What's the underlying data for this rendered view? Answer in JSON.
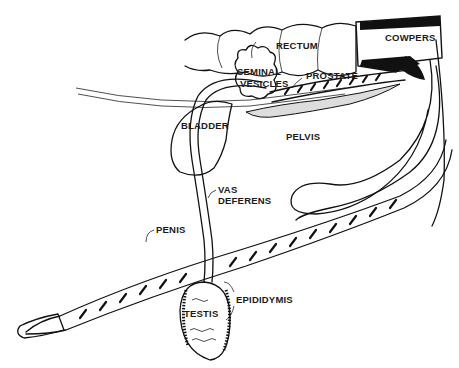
{
  "diagram": {
    "background": "#ffffff",
    "ink_color": "#111111",
    "labels": [
      {
        "id": "rectum",
        "text": "RECTUM",
        "x": 276,
        "y": 40
      },
      {
        "id": "cowpers",
        "text": "COWPERS",
        "x": 385,
        "y": 32
      },
      {
        "id": "seminal_vesicles_1",
        "text": "SEMINAL",
        "x": 237,
        "y": 68
      },
      {
        "id": "seminal_vesicles_2",
        "text": "VESICLES",
        "x": 240,
        "y": 81
      },
      {
        "id": "prostate",
        "text": "PROSTATE",
        "x": 306,
        "y": 72
      },
      {
        "id": "bladder",
        "text": "BLADDER",
        "x": 181,
        "y": 120
      },
      {
        "id": "pelvis",
        "text": "PELVIS",
        "x": 286,
        "y": 133
      },
      {
        "id": "vas_deferens_1",
        "text": "VAS",
        "x": 218,
        "y": 186
      },
      {
        "id": "vas_deferens_2",
        "text": "DEFERENS",
        "x": 218,
        "y": 197
      },
      {
        "id": "penis",
        "text": "PENIS",
        "x": 156,
        "y": 226
      },
      {
        "id": "testis",
        "text": "TESTIS",
        "x": 184,
        "y": 310
      },
      {
        "id": "epididymis",
        "text": "EPIDIDYMIS",
        "x": 235,
        "y": 296
      }
    ]
  }
}
